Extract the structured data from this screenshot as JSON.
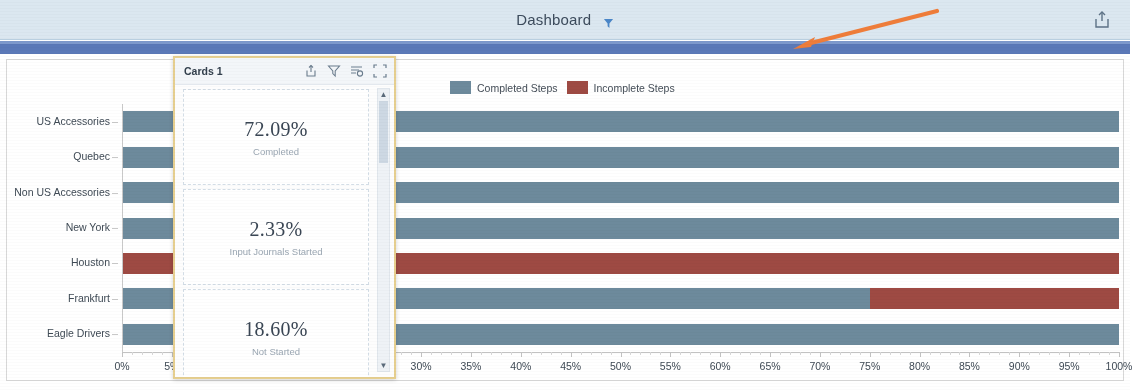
{
  "header": {
    "title": "Dashboard",
    "filter_icon": "filter-icon",
    "export_icon": "export-icon"
  },
  "cards_panel": {
    "title": "Cards 1",
    "icons": [
      "export-icon",
      "filter-icon",
      "sort-icon",
      "fullscreen-icon"
    ],
    "cards": [
      {
        "value": "72.09%",
        "label": "Completed"
      },
      {
        "value": "2.33%",
        "label": "Input Journals Started"
      },
      {
        "value": "18.60%",
        "label": "Not Started"
      }
    ],
    "scroll_up": "▲",
    "scroll_down": "▼"
  },
  "legend": {
    "items": [
      {
        "label": "Completed Steps",
        "color": "#6d8a9c"
      },
      {
        "label": "Incomplete Steps",
        "color": "#9e4a43"
      }
    ]
  },
  "colors": {
    "completed": "#6d8a9c",
    "incomplete": "#9e4a43",
    "ribbon": "#5b79b8",
    "header_band": "#dbe7f0",
    "arrow": "#ef7d3a",
    "card_border": "#e6cf8f"
  },
  "chart_data": {
    "type": "bar",
    "orientation": "horizontal",
    "stacked": true,
    "title": "",
    "xlabel": "",
    "ylabel": "",
    "xlim": [
      0,
      100
    ],
    "xticks": [
      0,
      5,
      10,
      15,
      20,
      25,
      30,
      35,
      40,
      45,
      50,
      55,
      60,
      65,
      70,
      75,
      80,
      85,
      90,
      95,
      100
    ],
    "xticklabels": [
      "0%",
      "5%",
      "10%",
      "15%",
      "20%",
      "25%",
      "30%",
      "35%",
      "40%",
      "45%",
      "50%",
      "55%",
      "60%",
      "65%",
      "70%",
      "75%",
      "80%",
      "85%",
      "90%",
      "95%",
      "100%"
    ],
    "categories": [
      "US Accessories",
      "Quebec",
      "Non US Accessories",
      "New York",
      "Houston",
      "Frankfurt",
      "Eagle Drivers"
    ],
    "series": [
      {
        "name": "Completed Steps",
        "color": "#6d8a9c",
        "values": [
          100,
          100,
          100,
          100,
          0,
          75,
          100
        ]
      },
      {
        "name": "Incomplete Steps",
        "color": "#9e4a43",
        "values": [
          0,
          0,
          0,
          0,
          100,
          25,
          0
        ]
      }
    ],
    "grid": false,
    "legend_position": "top"
  }
}
